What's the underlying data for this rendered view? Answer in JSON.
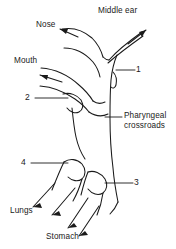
{
  "figure": {
    "title": "Pharyngeal crossroads",
    "type": "anatomical-line-diagram",
    "background_color": "#ffffff",
    "line_color": "#1a1a1a",
    "text_color": "#1a1a1a"
  },
  "labels": {
    "nose": "Nose",
    "middle_ear": "Middle ear",
    "mouth": "Mouth",
    "pharyngeal_crossroads": "Pharyngeal\ncrossroads",
    "lungs": "Lungs",
    "stomach": "Stomach"
  },
  "callouts": {
    "one": "1",
    "two": "2",
    "three": "3",
    "four": "4"
  }
}
